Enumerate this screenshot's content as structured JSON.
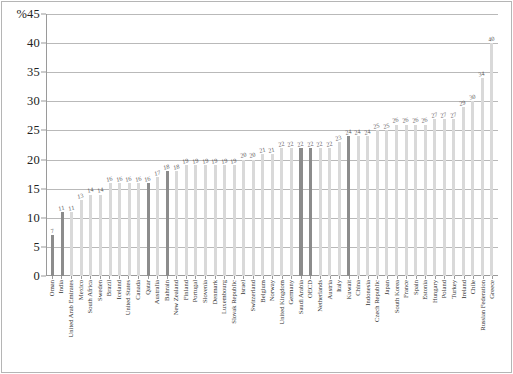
{
  "chart_data": {
    "type": "bar",
    "title": "",
    "xlabel": "",
    "ylabel": "",
    "y_unit_label": "%",
    "ylim": [
      0,
      45
    ],
    "ytick_step": 5,
    "yticks": [
      45,
      40,
      35,
      30,
      25,
      20,
      15,
      10,
      5,
      0
    ],
    "ytick_labels": [
      "%45",
      "40",
      "35",
      "30",
      "25",
      "20",
      "15",
      "10",
      "5",
      "0"
    ],
    "grid": true,
    "grid_axis": "y",
    "legend": "none",
    "bar_color": "#d9d9d9",
    "highlight_color": "#8c8c8c",
    "categories": [
      "Oman",
      "India",
      "United Arab Emirates",
      "Mexico",
      "South Africa",
      "Sweden",
      "Brazil",
      "Iceland",
      "United States",
      "Canada",
      "Qatar",
      "Australia",
      "Bahrain",
      "New Zealand",
      "Finland",
      "Portugal",
      "Slovenia",
      "Denmark",
      "Luxembourg",
      "Slovak Republic",
      "Israel",
      "Switzerland",
      "Belgium",
      "Norway",
      "United Kingdom",
      "Germany",
      "Saudi Arabia",
      "OECD",
      "Netherlands",
      "Austria",
      "Italy",
      "Kuwait",
      "China",
      "Indonesia",
      "Czech Republic",
      "Japan",
      "South Korea",
      "France",
      "Spain",
      "Estonia",
      "Hungary",
      "Poland",
      "Turkey",
      "Ireland",
      "Chile",
      "Russian Federation",
      "Greece"
    ],
    "values": [
      7,
      11,
      11,
      13,
      14,
      14,
      16,
      16,
      16,
      16,
      16,
      17,
      18,
      18,
      19,
      19,
      19,
      19,
      19,
      19,
      20,
      20,
      21,
      21,
      22,
      22,
      22,
      22,
      22,
      22,
      23,
      24,
      24,
      24,
      25,
      25,
      26,
      26,
      26,
      26,
      27,
      27,
      27,
      29,
      30,
      34,
      40
    ],
    "highlighted": [
      "Oman",
      "India",
      "Qatar",
      "Bahrain",
      "Saudi Arabia",
      "OECD",
      "Kuwait"
    ]
  }
}
